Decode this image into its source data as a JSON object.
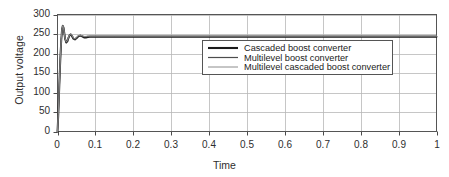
{
  "chart_data": {
    "type": "line",
    "title": "",
    "xlabel": "Time",
    "ylabel": "Output voltage",
    "xlim": [
      0,
      1
    ],
    "ylim": [
      0,
      300
    ],
    "grid": true,
    "xticks": [
      "0",
      "0.1",
      "0.2",
      "0.3",
      "0.4",
      "0.5",
      "0.6",
      "0.7",
      "0.8",
      "0.9",
      "1"
    ],
    "xtick_values": [
      0,
      0.1,
      0.2,
      0.3,
      0.4,
      0.5,
      0.6,
      0.7,
      0.8,
      0.9,
      1
    ],
    "yticks": [
      "0",
      "50",
      "100",
      "150",
      "200",
      "250",
      "300"
    ],
    "ytick_values": [
      0,
      50,
      100,
      150,
      200,
      250,
      300
    ],
    "legend_position": "center",
    "series": [
      {
        "name": "Cascaded boost converter",
        "color": "#1a1a1a",
        "width": 1.9,
        "steady_state": 243,
        "x": [
          0,
          0.002,
          0.004,
          0.006,
          0.008,
          0.01,
          0.012,
          0.014,
          0.016,
          0.018,
          0.02,
          0.023,
          0.026,
          0.029,
          0.032,
          0.035,
          0.038,
          0.042,
          0.046,
          0.05,
          0.055,
          0.06,
          0.065,
          0.07,
          0.075,
          0.08,
          0.085,
          0.09,
          0.1,
          0.15,
          0.2,
          0.3,
          0.4,
          0.5,
          0.6,
          0.7,
          0.8,
          0.9,
          1.0
        ],
        "y": [
          0,
          42,
          96,
          150,
          198,
          236,
          262,
          271,
          266,
          252,
          238,
          228,
          231,
          240,
          247,
          249,
          245,
          238,
          236,
          239,
          244,
          246,
          244,
          241,
          241,
          242,
          243,
          243,
          243,
          243,
          243,
          243,
          243,
          243,
          243,
          243,
          243,
          243,
          243
        ]
      },
      {
        "name": "Multilevel boost converter",
        "color": "#4d4d4d",
        "width": 1.2,
        "steady_state": 244,
        "x": [
          0,
          0.002,
          0.004,
          0.006,
          0.008,
          0.01,
          0.012,
          0.014,
          0.016,
          0.018,
          0.02,
          0.023,
          0.026,
          0.029,
          0.032,
          0.035,
          0.038,
          0.042,
          0.046,
          0.05,
          0.055,
          0.06,
          0.065,
          0.07,
          0.075,
          0.08,
          0.085,
          0.09,
          0.1,
          0.15,
          0.2,
          0.3,
          0.4,
          0.5,
          0.6,
          0.7,
          0.8,
          0.9,
          1.0
        ],
        "y": [
          0,
          40,
          93,
          147,
          195,
          233,
          259,
          268,
          264,
          251,
          238,
          229,
          232,
          241,
          247,
          249,
          246,
          239,
          237,
          240,
          245,
          246,
          245,
          243,
          243,
          244,
          244,
          244,
          244,
          244,
          244,
          244,
          244,
          244,
          244,
          244,
          244,
          244,
          244
        ]
      },
      {
        "name": "Multilevel cascaded boost converter",
        "color": "#8c8c8c",
        "width": 1.0,
        "steady_state": 245,
        "x": [
          0,
          0.002,
          0.004,
          0.006,
          0.008,
          0.01,
          0.012,
          0.014,
          0.016,
          0.018,
          0.02,
          0.023,
          0.026,
          0.029,
          0.032,
          0.035,
          0.038,
          0.042,
          0.046,
          0.05,
          0.055,
          0.06,
          0.065,
          0.07,
          0.075,
          0.08,
          0.085,
          0.09,
          0.1,
          0.15,
          0.2,
          0.3,
          0.4,
          0.5,
          0.6,
          0.7,
          0.8,
          0.9,
          1.0
        ],
        "y": [
          0,
          44,
          99,
          153,
          201,
          238,
          264,
          272,
          267,
          253,
          239,
          230,
          233,
          242,
          248,
          250,
          247,
          240,
          238,
          241,
          246,
          247,
          246,
          244,
          244,
          245,
          245,
          245,
          245,
          245,
          245,
          245,
          245,
          245,
          245,
          245,
          245,
          245,
          245
        ]
      }
    ]
  },
  "legend": {
    "entries": [
      "Cascaded boost converter",
      "Multilevel boost converter",
      "Multilevel cascaded boost converter"
    ]
  },
  "colors": {
    "axis": "#4a4a4a",
    "grid": "#b8b8b8",
    "frame": "#555555",
    "background": "#ffffff"
  }
}
